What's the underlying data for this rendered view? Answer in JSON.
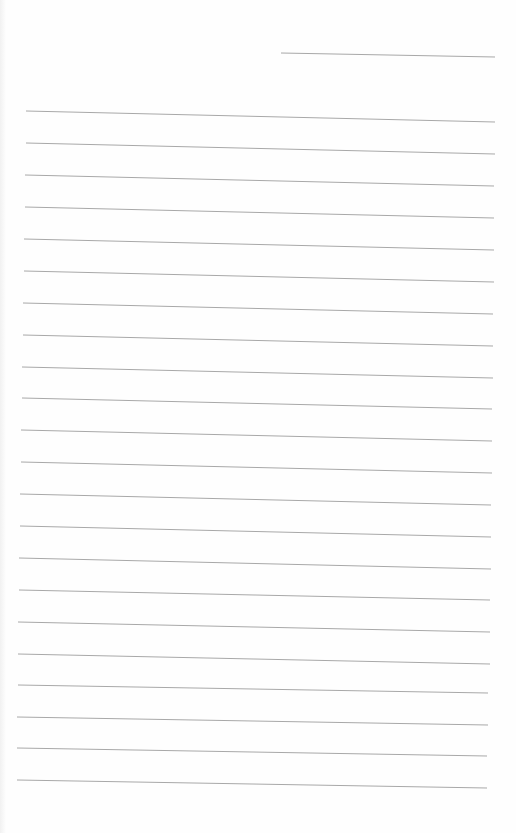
{
  "page": {
    "type": "blank lined notebook page",
    "background_color": "#fefefe",
    "line_color": "#a8a8a8"
  },
  "header_line": {
    "x1": 281,
    "y1": 53,
    "x2": 495,
    "y2": 57
  },
  "ruled_lines": [
    {
      "x1": 26,
      "y1": 111,
      "x2": 495,
      "y2": 122
    },
    {
      "x1": 26,
      "y1": 143,
      "x2": 495,
      "y2": 154
    },
    {
      "x1": 25,
      "y1": 175,
      "x2": 494,
      "y2": 186
    },
    {
      "x1": 25,
      "y1": 207,
      "x2": 494,
      "y2": 218
    },
    {
      "x1": 24,
      "y1": 239,
      "x2": 494,
      "y2": 250
    },
    {
      "x1": 24,
      "y1": 271,
      "x2": 494,
      "y2": 282
    },
    {
      "x1": 23,
      "y1": 303,
      "x2": 493,
      "y2": 314
    },
    {
      "x1": 23,
      "y1": 335,
      "x2": 493,
      "y2": 346
    },
    {
      "x1": 22,
      "y1": 367,
      "x2": 493,
      "y2": 378
    },
    {
      "x1": 22,
      "y1": 398,
      "x2": 492,
      "y2": 409
    },
    {
      "x1": 21,
      "y1": 430,
      "x2": 492,
      "y2": 441
    },
    {
      "x1": 21,
      "y1": 462,
      "x2": 492,
      "y2": 473
    },
    {
      "x1": 20,
      "y1": 494,
      "x2": 491,
      "y2": 505
    },
    {
      "x1": 20,
      "y1": 526,
      "x2": 491,
      "y2": 537
    },
    {
      "x1": 19,
      "y1": 558,
      "x2": 491,
      "y2": 569
    },
    {
      "x1": 19,
      "y1": 590,
      "x2": 490,
      "y2": 600
    },
    {
      "x1": 18,
      "y1": 622,
      "x2": 490,
      "y2": 632
    },
    {
      "x1": 18,
      "y1": 654,
      "x2": 490,
      "y2": 664
    },
    {
      "x1": 18,
      "y1": 685,
      "x2": 488,
      "y2": 693
    },
    {
      "x1": 17,
      "y1": 717,
      "x2": 488,
      "y2": 725
    },
    {
      "x1": 17,
      "y1": 748,
      "x2": 487,
      "y2": 756
    },
    {
      "x1": 17,
      "y1": 780,
      "x2": 487,
      "y2": 788
    }
  ]
}
